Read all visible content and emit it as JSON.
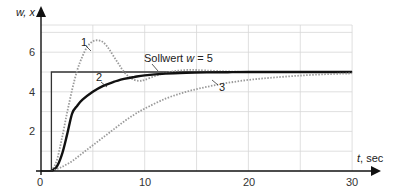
{
  "chart_data": {
    "type": "line",
    "title": "",
    "xlabel": "t, sec",
    "ylabel": "w, x",
    "xlim": [
      0,
      30
    ],
    "ylim": [
      0,
      7.3
    ],
    "x_ticks": [
      0,
      10,
      20,
      30
    ],
    "y_ticks": [
      2,
      4,
      6
    ],
    "grid": true,
    "annotation": "Sollwert w = 5",
    "series": [
      {
        "name": "Sollwert w",
        "style": "solid-thin",
        "x": [
          0,
          1,
          1,
          30
        ],
        "y": [
          0,
          0,
          5,
          5
        ]
      },
      {
        "name": "1",
        "style": "dotted",
        "x": [
          1,
          1.5,
          2,
          2.5,
          3,
          3.5,
          4,
          4.5,
          5,
          5.5,
          6,
          6.5,
          7,
          7.5,
          8,
          8.5,
          9,
          9.5,
          10,
          11,
          12,
          13,
          14,
          15,
          17,
          20,
          25,
          30
        ],
        "y": [
          0,
          0.5,
          1.6,
          2.9,
          4.1,
          5.1,
          5.8,
          6.3,
          6.55,
          6.6,
          6.5,
          6.2,
          5.8,
          5.4,
          5.0,
          4.75,
          4.6,
          4.55,
          4.6,
          4.8,
          4.95,
          5.05,
          5.1,
          5.1,
          5.05,
          5.0,
          5.0,
          5.0
        ]
      },
      {
        "name": "2",
        "style": "solid-thick",
        "x": [
          1,
          1.5,
          2,
          2.5,
          3,
          3.5,
          4,
          5,
          6,
          7,
          8,
          9,
          10,
          12,
          14,
          16,
          18,
          20,
          25,
          30
        ],
        "y": [
          0,
          0.2,
          0.8,
          1.8,
          2.9,
          3.3,
          3.6,
          4.0,
          4.3,
          4.5,
          4.65,
          4.75,
          4.83,
          4.92,
          4.96,
          4.98,
          4.99,
          5.0,
          5.0,
          5.0
        ]
      },
      {
        "name": "3",
        "style": "dotted",
        "x": [
          1,
          2,
          3,
          4,
          5,
          6,
          7,
          8,
          9,
          10,
          12,
          14,
          16,
          18,
          20,
          22,
          25,
          28,
          30
        ],
        "y": [
          0,
          0.2,
          0.5,
          0.9,
          1.3,
          1.7,
          2.1,
          2.5,
          2.85,
          3.15,
          3.65,
          4.0,
          4.25,
          4.45,
          4.6,
          4.7,
          4.82,
          4.9,
          4.93
        ]
      }
    ],
    "curve_labels": [
      {
        "text": "1",
        "x": 4.0,
        "y": 6.7
      },
      {
        "text": "2",
        "x": 5.5,
        "y": 4.35
      },
      {
        "text": "3",
        "x": 18.8,
        "y": 3.9
      }
    ]
  },
  "axes": {
    "y_label": "w, x",
    "x_label_var": "t",
    "x_label_unit": ", sec",
    "annotation_prefix": "Sollwert ",
    "annotation_var": "w",
    "annotation_suffix": " = 5",
    "x_ticks": [
      "0",
      "10",
      "20",
      "30"
    ],
    "y_ticks": [
      "2",
      "4",
      "6"
    ]
  },
  "colors": {
    "axis": "#111111",
    "grid": "#d8d8d8",
    "setpoint": "#333333",
    "curve2": "#111111",
    "dotted": "#9a9a9a"
  }
}
